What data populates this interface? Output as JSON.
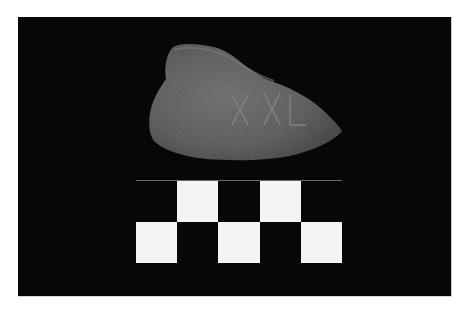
{
  "image": {
    "description": "Photograph of an inscribed stone/ceramic fragment on a black background with a black-and-white checkered scale bar below it",
    "background_color": "#070707",
    "page_background": "#ffffff"
  },
  "artifact": {
    "name": "Inscribed fragment",
    "color": "#5e5e5e",
    "inscription_marks": [
      "X",
      "X",
      "L"
    ]
  },
  "scale_bar": {
    "rows": 2,
    "columns": 5,
    "pattern": [
      [
        "black",
        "white",
        "black",
        "white",
        "black"
      ],
      [
        "white",
        "black",
        "white",
        "black",
        "white"
      ]
    ],
    "white_color": "#f4f4f2",
    "black_color": "#070707"
  }
}
